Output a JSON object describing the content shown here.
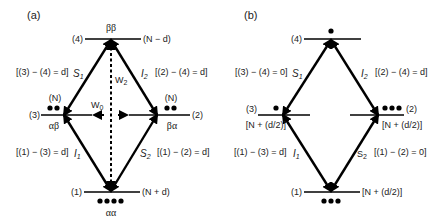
{
  "panel_a": {
    "label": "(a)",
    "levels": {
      "top": {
        "index": "(4)",
        "state": "ββ",
        "population": "(N − d)"
      },
      "left": {
        "index": "(3)",
        "state": "αβ",
        "population": "(N)"
      },
      "right": {
        "index": "(2)",
        "state": "βα",
        "population": "(N)"
      },
      "bottom": {
        "index": "(1)",
        "state": "αα",
        "population": "(N + d)"
      }
    },
    "transitions": {
      "s1": {
        "label": "S",
        "sub": "1",
        "eq": "[(3) − (4) = d]"
      },
      "i2": {
        "label": "I",
        "sub": "2",
        "eq": "[(2) − (4) = d]"
      },
      "i1": {
        "label": "I",
        "sub": "1",
        "eq": "[(1) − (3) = d]"
      },
      "s2": {
        "label": "S",
        "sub": "2",
        "eq": "[(1) − (2) = d]"
      },
      "w2": {
        "label": "W",
        "sub": "2"
      },
      "w0": {
        "label": "W",
        "sub": "0"
      }
    },
    "dots": {
      "top": 0,
      "left": 2,
      "right": 2,
      "bottom": 4
    }
  },
  "panel_b": {
    "label": "(b)",
    "levels": {
      "top": {
        "index": "(4)"
      },
      "left": {
        "index": "(3)",
        "population": "[N + (d/2)]"
      },
      "right": {
        "index": "(2)",
        "population": "[N + (d/2)]"
      },
      "bottom": {
        "index": "(1)",
        "population": "[N + (d/2)]"
      }
    },
    "transitions": {
      "s1": {
        "label": "S",
        "sub": "1",
        "eq": "[(3) − (4) = 0]"
      },
      "i2": {
        "label": "I",
        "sub": "2",
        "eq": "[(2) − (4) = d]"
      },
      "i1": {
        "label": "I",
        "sub": "1",
        "eq": "[(1) − (3) = d]"
      },
      "s2": {
        "label": "S",
        "sub": "2",
        "eq": "[(1) − (2) = 0]"
      }
    },
    "dots": {
      "top": 1,
      "left": 1,
      "right": 3,
      "bottom": 3
    }
  }
}
